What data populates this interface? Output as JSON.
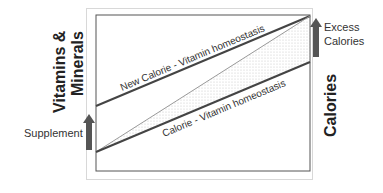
{
  "diagram": {
    "y_axis_label_line1": "Vitamins &",
    "y_axis_label_line2": "Minerals",
    "right_axis_label": "Calories",
    "supplement_label": "Supplement",
    "excess_label_line1": "Excess",
    "excess_label_line2": "Calories",
    "upper_line_label": "New Calorie - Vitamin homeostasis",
    "lower_line_label": "Calorie - Vitamin homeostasis",
    "colors": {
      "line_dark": "#444444",
      "line_light": "#999999",
      "arrow": "#555555",
      "frame": "#555555",
      "dots": "#bbbbbb"
    }
  }
}
